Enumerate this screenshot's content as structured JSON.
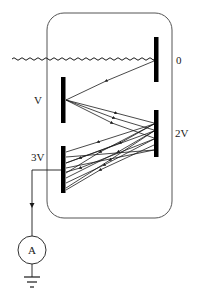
{
  "diagram": {
    "type": "dynode-electron-multiplier",
    "colors": {
      "line": "#1a1a1a",
      "electrode": "#000000",
      "enclosure": "#555555",
      "background": "#ffffff"
    },
    "electrodes": [
      {
        "id": "photocathode",
        "label": "0",
        "x": 154,
        "y1": 37,
        "y2": 82
      },
      {
        "id": "dynode-1",
        "label": "V",
        "x": 61,
        "y1": 77,
        "y2": 123
      },
      {
        "id": "dynode-2",
        "label": "2V",
        "x": 154,
        "y1": 110,
        "y2": 157
      },
      {
        "id": "anode",
        "label": "3V",
        "x": 61,
        "y1": 146,
        "y2": 193
      }
    ],
    "labels": {
      "cathode_potential": "0",
      "dynode1_potential": "V",
      "dynode2_potential": "2V",
      "anode_potential": "3V",
      "meter": "A"
    },
    "incident_light": "wavy line (photon)",
    "meter": {
      "type": "ammeter",
      "symbol": "A"
    },
    "ground": "ground symbol"
  }
}
